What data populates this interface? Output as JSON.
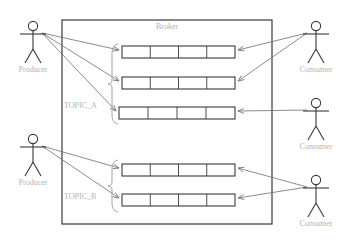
{
  "diagram": {
    "broker_label": "Broker",
    "background_color": "#ffffff",
    "box_stroke_color": "#3a3a3a",
    "label_color": "#b3b3b3",
    "arrow_color": "#6f6f6f"
  },
  "broker": {
    "label": "Broker",
    "box": {
      "x": 62,
      "y": 20,
      "width": 210,
      "height": 204
    }
  },
  "topics": [
    {
      "name": "TOPIC_A",
      "label": "TOPIC_A",
      "label_x": 64,
      "label_y": 108,
      "brace": {
        "x": 112,
        "y_top": 44,
        "y_bottom": 124
      },
      "partitions": [
        {
          "index": 0,
          "x": 122,
          "y": 46,
          "width": 113,
          "height": 12,
          "cells": 4
        },
        {
          "index": 1,
          "x": 122,
          "y": 77,
          "width": 113,
          "height": 12,
          "cells": 4
        },
        {
          "index": 2,
          "x": 119,
          "y": 107,
          "width": 116,
          "height": 12,
          "cells": 4
        }
      ]
    },
    {
      "name": "TOPIC_B",
      "label": "TOPIC_B",
      "label_x": 64,
      "label_y": 199,
      "brace": {
        "x": 112,
        "y_top": 160,
        "y_bottom": 212
      },
      "partitions": [
        {
          "index": 0,
          "x": 122,
          "y": 164,
          "width": 113,
          "height": 12,
          "cells": 4
        },
        {
          "index": 1,
          "x": 122,
          "y": 194,
          "width": 113,
          "height": 12,
          "cells": 4
        }
      ]
    }
  ],
  "actors": [
    {
      "id": "producer-top",
      "role": "Producer",
      "label": "Producer",
      "side": "left",
      "head_x": 33,
      "head_y": 26,
      "label_x": 33,
      "label_y": 72
    },
    {
      "id": "producer-bottom",
      "role": "Producer",
      "label": "Producer",
      "side": "left",
      "head_x": 33,
      "head_y": 139,
      "label_x": 33,
      "label_y": 185
    },
    {
      "id": "consumer-1",
      "role": "Consumer",
      "label": "Consumer",
      "side": "right",
      "head_x": 316,
      "head_y": 26,
      "label_x": 316,
      "label_y": 72
    },
    {
      "id": "consumer-2",
      "role": "Consumer",
      "label": "Consumer",
      "side": "right",
      "head_x": 316,
      "head_y": 103,
      "label_x": 316,
      "label_y": 149
    },
    {
      "id": "consumer-3",
      "role": "Consumer",
      "label": "Consumer",
      "side": "right",
      "head_x": 316,
      "head_y": 180,
      "label_x": 316,
      "label_y": 226
    }
  ],
  "connections": [
    {
      "from": "producer-top",
      "to": "topic-a-partition-0",
      "x1": 42,
      "y1": 33,
      "x2": 119,
      "y2": 50
    },
    {
      "from": "producer-top",
      "to": "topic-a-partition-1",
      "x1": 42,
      "y1": 33,
      "x2": 119,
      "y2": 81
    },
    {
      "from": "producer-top",
      "to": "topic-a-partition-2",
      "x1": 42,
      "y1": 33,
      "x2": 116,
      "y2": 111
    },
    {
      "from": "producer-bottom",
      "to": "topic-b-partition-0",
      "x1": 42,
      "y1": 146,
      "x2": 119,
      "y2": 168
    },
    {
      "from": "producer-bottom",
      "to": "topic-b-partition-1",
      "x1": 42,
      "y1": 146,
      "x2": 119,
      "y2": 198
    },
    {
      "from": "consumer-1",
      "to": "topic-a-partition-0",
      "x1": 307,
      "y1": 33,
      "x2": 238,
      "y2": 50
    },
    {
      "from": "consumer-1",
      "to": "topic-a-partition-1",
      "x1": 307,
      "y1": 33,
      "x2": 238,
      "y2": 81
    },
    {
      "from": "consumer-2",
      "to": "topic-a-partition-2",
      "x1": 307,
      "y1": 110,
      "x2": 238,
      "y2": 111
    },
    {
      "from": "consumer-3",
      "to": "topic-b-partition-0",
      "x1": 307,
      "y1": 187,
      "x2": 238,
      "y2": 168
    },
    {
      "from": "consumer-3",
      "to": "topic-b-partition-1",
      "x1": 307,
      "y1": 187,
      "x2": 238,
      "y2": 198
    }
  ]
}
